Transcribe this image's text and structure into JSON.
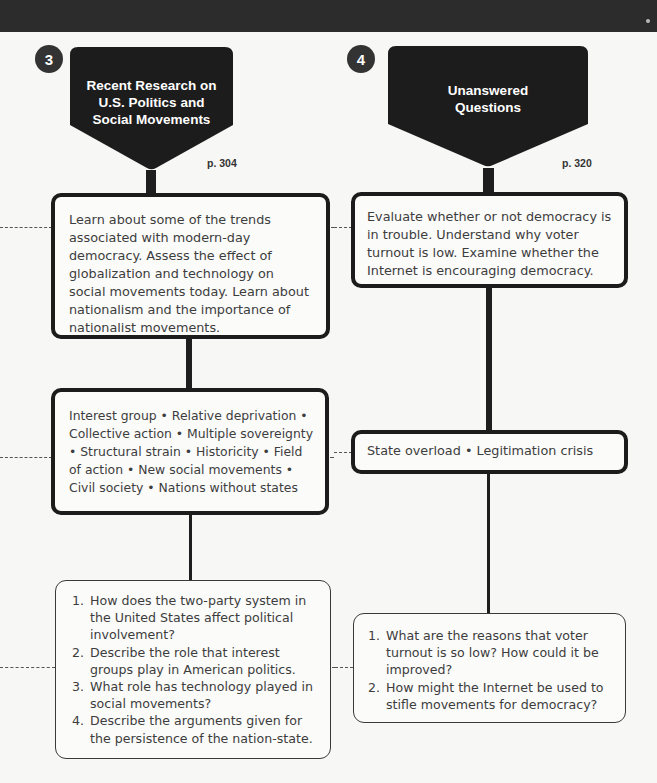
{
  "columns": [
    {
      "number": "3",
      "header": [
        "Recent Research on",
        "U.S. Politics and",
        "Social Movements"
      ],
      "page_ref": "p. 304",
      "objectives": "Learn about some of the trends associated with modern-day democracy. Assess the effect of globalization and technology on social movements today. Learn about nationalism and the importance of nationalist movements.",
      "key_terms": "Interest group • Relative deprivation • Collective action • Multiple sovereignty • Structural strain • Historicity • Field of action • New social movements • Civil society • Nations without states",
      "questions": [
        "How does the two-party system in the United States affect political involvement?",
        "Describe the role that interest groups play in American politics.",
        "What role has technology played in social movements?",
        "Describe the arguments given for the persistence of the nation-state."
      ]
    },
    {
      "number": "4",
      "header": [
        "Unanswered",
        "Questions"
      ],
      "page_ref": "p. 320",
      "objectives": "Evaluate whether or not democracy is in trouble. Understand why voter turnout is low. Examine whether the Internet is encouraging democracy.",
      "key_terms": "State overload • Legitimation crisis",
      "questions": [
        "What are the reasons that voter turnout is so low? How could it be improved?",
        "How might the Internet be used to stifle movements for democracy?"
      ]
    }
  ],
  "colors": {
    "top_bar": "#2c2c2c",
    "header_fill": "#1c1c1c",
    "background": "#f7f7f5",
    "text": "#3d3d3d"
  }
}
